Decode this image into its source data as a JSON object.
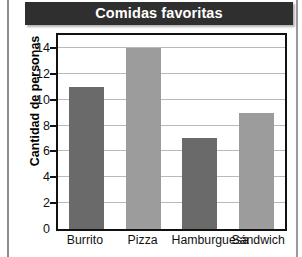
{
  "chart_data": {
    "type": "bar",
    "title": "Comidas favoritas",
    "xlabel": "",
    "ylabel": "Cantidad de personas",
    "categories": [
      "Burrito",
      "Pizza",
      "Hamburguesa",
      "Sándwich"
    ],
    "values": [
      11,
      14,
      7,
      9
    ],
    "ylim": [
      0,
      15
    ],
    "yticks": [
      0,
      2,
      4,
      6,
      8,
      10,
      12,
      14
    ],
    "ytick_labels": [
      "0",
      "2",
      "4",
      "6",
      "8",
      "10",
      "12",
      "14"
    ],
    "grid": true,
    "legend": "none",
    "bar_colors": [
      "#6a6a6a",
      "#9c9c9c",
      "#6a6a6a",
      "#9c9c9c"
    ],
    "colors": {
      "title_bar_background": "#2f2f2f",
      "title_text": "#ffffff",
      "plot_background": "#ffffff",
      "plot_border": "#111111",
      "gridline": "#b9b9b9",
      "axis_text": "#111111",
      "bar_dark": "#6a6a6a",
      "bar_light": "#9c9c9c"
    }
  }
}
